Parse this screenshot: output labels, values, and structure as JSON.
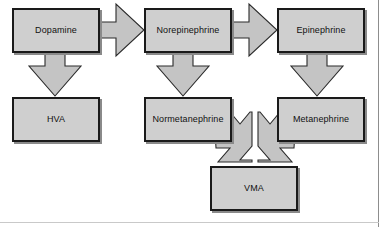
{
  "diagram": {
    "background_color": "#ffffff",
    "node_fill_color": "#cfcfcf",
    "node_border_color": "#1a1a1a",
    "arrow_fill_color": "#c4c4c4",
    "arrow_border_color": "#2b2b2b",
    "nodes": [
      {
        "id": "dopamine",
        "label": "Dopamine"
      },
      {
        "id": "norepinephrine",
        "label": "Norepinephrine"
      },
      {
        "id": "epinephrine",
        "label": "Epinephrine"
      },
      {
        "id": "hva",
        "label": "HVA"
      },
      {
        "id": "normetanephrine",
        "label": "Normetanephrine"
      },
      {
        "id": "metanephrine",
        "label": "Metanephrine"
      },
      {
        "id": "vma",
        "label": "VMA"
      }
    ],
    "arrows": [
      {
        "id": "dopamine-to-norepinephrine",
        "direction": "right"
      },
      {
        "id": "norepinephrine-to-epinephrine",
        "direction": "right"
      },
      {
        "id": "dopamine-to-hva",
        "direction": "down"
      },
      {
        "id": "norepinephrine-to-normetanephrine",
        "direction": "down"
      },
      {
        "id": "epinephrine-to-metanephrine",
        "direction": "down"
      },
      {
        "id": "normetanephrine-to-vma",
        "direction": "down-right-converging"
      },
      {
        "id": "metanephrine-to-vma",
        "direction": "down-left-converging"
      }
    ]
  }
}
